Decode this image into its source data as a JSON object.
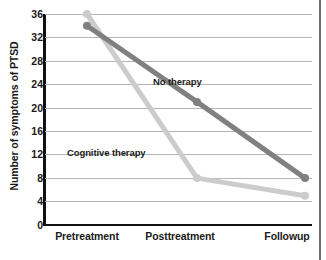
{
  "chart_data": {
    "type": "line",
    "title": "",
    "xlabel": "",
    "ylabel": "Number of symptoms of PTSD",
    "categories": [
      "Pretreatment",
      "Posttreatment",
      "Followup"
    ],
    "ylim": [
      0,
      36
    ],
    "yticks": [
      36,
      32,
      28,
      24,
      20,
      16,
      12,
      8,
      4,
      0
    ],
    "grid": true,
    "legend_position": "inline-annotations",
    "series": [
      {
        "name": "No therapy",
        "values": [
          34,
          21,
          8
        ],
        "color": "#808080",
        "marker": "circle"
      },
      {
        "name": "Cognitive therapy",
        "values": [
          36,
          8,
          5
        ],
        "color": "#cccccc",
        "marker": "circle"
      }
    ],
    "annotations": [
      {
        "text": "No therapy",
        "series": "No therapy"
      },
      {
        "text": "Cognitive therapy",
        "series": "Cognitive therapy"
      }
    ]
  },
  "axis": {
    "y_title": "Number of symptoms of PTSD",
    "y_tick_labels": [
      "36",
      "32",
      "28",
      "24",
      "20",
      "16",
      "12",
      "8",
      "4",
      "0"
    ],
    "x_tick_labels": [
      "Pretreatment",
      "Posttreatment",
      "Followup"
    ]
  },
  "labels": {
    "no_therapy": "No therapy",
    "cognitive_therapy": "Cognitive therapy"
  },
  "colors": {
    "no_therapy": "#808080",
    "cognitive_therapy": "#cccccc",
    "grid": "#b4b4b4",
    "axis": "#111111",
    "frame_rule": "#6f6f6f",
    "text": "#1a1a1a"
  }
}
